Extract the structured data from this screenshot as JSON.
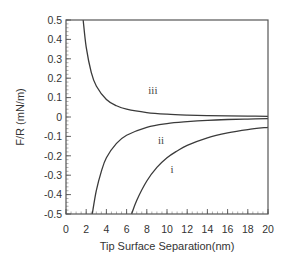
{
  "chart_data": {
    "type": "line",
    "title": "",
    "xlabel": "Tip Surface Separation(nm)",
    "ylabel": "F/R (mN/m)",
    "xlim": [
      0,
      20
    ],
    "ylim": [
      -0.5,
      0.5
    ],
    "x_ticks": [
      0,
      2,
      4,
      6,
      8,
      10,
      12,
      14,
      16,
      18,
      20
    ],
    "y_ticks": [
      0.5,
      0.4,
      0.3,
      0.2,
      0.1,
      0,
      -0.1,
      -0.2,
      -0.3,
      -0.4,
      -0.5
    ],
    "y_tick_labels": [
      "0.5",
      "0.4",
      "0.3",
      "0.2",
      "0.1",
      "0",
      "-0.1",
      "-0.2",
      "-0.3",
      "-0.4",
      "-0.5"
    ],
    "grid": false,
    "legend": "none (curves labelled inline)",
    "series": [
      {
        "name": "iii",
        "label_pos": [
          8.6,
          0.14
        ],
        "x": [
          1.7,
          2,
          2.5,
          3,
          4,
          5,
          6,
          8,
          10,
          12,
          14,
          16,
          18,
          20
        ],
        "values": [
          0.5,
          0.36,
          0.23,
          0.16,
          0.09,
          0.058,
          0.04,
          0.023,
          0.0145,
          0.01,
          0.0074,
          0.0057,
          0.0045,
          0.0036
        ]
      },
      {
        "name": "ii",
        "label_pos": [
          9.4,
          -0.12
        ],
        "x": [
          2.6,
          3,
          3.5,
          4,
          5,
          6,
          8,
          10,
          12,
          14,
          16,
          18,
          20
        ],
        "values": [
          -0.5,
          -0.38,
          -0.28,
          -0.21,
          -0.136,
          -0.094,
          -0.053,
          -0.034,
          -0.024,
          -0.017,
          -0.013,
          -0.0105,
          -0.0085
        ]
      },
      {
        "name": "i",
        "label_pos": [
          10.5,
          -0.27
        ],
        "x": [
          6.5,
          7,
          8,
          9,
          10,
          11,
          12,
          14,
          16,
          18,
          20
        ],
        "values": [
          -0.5,
          -0.43,
          -0.33,
          -0.26,
          -0.21,
          -0.175,
          -0.146,
          -0.107,
          -0.082,
          -0.065,
          -0.053
        ]
      }
    ]
  }
}
